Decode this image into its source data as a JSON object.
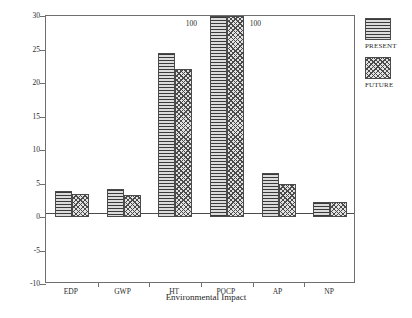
{
  "chart_data": {
    "type": "bar",
    "title": "",
    "xlabel": "Environmental Impact",
    "ylabel": "Standardized Impact",
    "categories": [
      "EDP",
      "GWP",
      "HT",
      "POCP",
      "AP",
      "NP"
    ],
    "series": [
      {
        "name": "PRESENT",
        "pattern": "horizontal-lines",
        "values": [
          3.9,
          4.2,
          24.5,
          100,
          6.5,
          2.3
        ]
      },
      {
        "name": "FUTURE",
        "pattern": "checkerboard",
        "values": [
          3.5,
          3.3,
          22.1,
          100,
          5.0,
          2.2
        ]
      }
    ],
    "ylim": [
      -10,
      30
    ],
    "yticks": [
      -10,
      -5,
      0,
      5,
      10,
      15,
      20,
      25,
      30
    ],
    "ytick_labels": [
      "-10",
      "-5",
      "0",
      "5",
      "10",
      "15",
      "20",
      "25",
      "30"
    ],
    "grid": false,
    "legend_position": "right",
    "annotations": [
      {
        "text": "100",
        "category": "POCP",
        "series": "PRESENT",
        "note": "bar clipped at axis maximum"
      },
      {
        "text": "100",
        "category": "POCP",
        "series": "FUTURE",
        "note": "bar clipped at axis maximum"
      }
    ]
  },
  "legend": {
    "entries": [
      {
        "label": "PRESENT"
      },
      {
        "label": "FUTURE"
      }
    ]
  },
  "colors": {
    "axis": "#6f6f6f",
    "bar_outline": "#4a4a4a",
    "text": "#2b2b2b",
    "background": "#ffffff"
  }
}
